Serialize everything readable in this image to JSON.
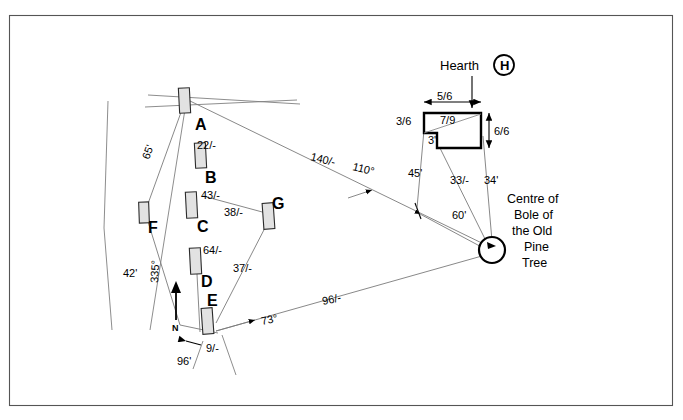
{
  "diagram": {
    "type": "archaeological-survey-plan",
    "title_elements": {
      "hearth_label": "Hearth",
      "hearth_symbol": "H",
      "tree_label_lines": [
        "Centre of",
        "Bole of",
        "the Old",
        "Pine",
        "Tree"
      ]
    },
    "north_indicator": {
      "label": "N",
      "bearing_label": "335°"
    },
    "stones": [
      {
        "id": "A",
        "label": "A",
        "measure": ""
      },
      {
        "id": "B",
        "label": "B",
        "measure": "22/-"
      },
      {
        "id": "C",
        "label": "C",
        "measure": "43/-"
      },
      {
        "id": "D",
        "label": "D",
        "measure": "64/-"
      },
      {
        "id": "E",
        "label": "E",
        "measure": ""
      },
      {
        "id": "F",
        "label": "F",
        "measure": ""
      },
      {
        "id": "G",
        "label": "G",
        "measure": ""
      }
    ],
    "measurements": [
      {
        "name": "a-f-distance",
        "text": "65'"
      },
      {
        "name": "b-offset",
        "text": "22/-"
      },
      {
        "name": "c-offset",
        "text": "43/-"
      },
      {
        "name": "c-g-distance",
        "text": "38/-"
      },
      {
        "name": "d-offset",
        "text": "64/-"
      },
      {
        "name": "g-e-distance",
        "text": "37/-"
      },
      {
        "name": "f-bottom-distance",
        "text": "42'"
      },
      {
        "name": "north-bearing",
        "text": "335°"
      },
      {
        "name": "e-offset",
        "text": "9/-"
      },
      {
        "name": "bottom-baseline",
        "text": "96'"
      },
      {
        "name": "e-tree-bearing",
        "text": "73°"
      },
      {
        "name": "e-tree-distance",
        "text": "96/-"
      },
      {
        "name": "a-tree-distance",
        "text": "140/-"
      },
      {
        "name": "a-tree-bearing",
        "text": "110°"
      },
      {
        "name": "hearth-left-distance",
        "text": "45'"
      },
      {
        "name": "hearth-mid-distance",
        "text": "33/-"
      },
      {
        "name": "hearth-right-distance",
        "text": "34'"
      },
      {
        "name": "station-tree-distance",
        "text": "60'"
      }
    ],
    "hearth_dimensions": [
      {
        "name": "hearth-top-width",
        "text": "5/6"
      },
      {
        "name": "hearth-left-height",
        "text": "3/6"
      },
      {
        "name": "hearth-diagonal",
        "text": "7/9"
      },
      {
        "name": "hearth-notch",
        "text": "3'"
      },
      {
        "name": "hearth-right-height",
        "text": "6/6"
      }
    ]
  },
  "colors": {
    "frame": "#555555",
    "survey_line": "#7a7a7a",
    "stone_fill": "#e2e2e2",
    "stone_stroke": "#2b2b2b",
    "hearth_stroke": "#000000",
    "text": "#000000"
  }
}
